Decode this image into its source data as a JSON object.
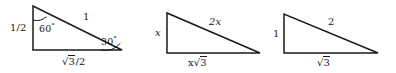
{
  "figure": {
    "background_color": "#ffffff",
    "stroke_color": "#1a1a1a",
    "text_color": "#1a1a1a"
  },
  "triangles": [
    {
      "id": "triangle-half-unit",
      "vertical_leg_label": "1/2",
      "hypotenuse_label": "1",
      "horizontal_leg_label_parts": {
        "prefix": "",
        "radical": "3",
        "suffix": "/2"
      },
      "horizontal_leg_label_text": "√3/2",
      "top_angle_label": "60",
      "top_angle_degree_symbol": "°",
      "bottom_angle_label": "30",
      "bottom_angle_degree_symbol": "°"
    },
    {
      "id": "triangle-variable-x",
      "vertical_leg_label": "x",
      "hypotenuse_label": "2x",
      "horizontal_leg_label_parts": {
        "prefix": "x",
        "radical": "3",
        "suffix": ""
      },
      "horizontal_leg_label_text": "x√3"
    },
    {
      "id": "triangle-unit-one",
      "vertical_leg_label": "1",
      "hypotenuse_label": "2",
      "horizontal_leg_label_parts": {
        "prefix": "",
        "radical": "3",
        "suffix": ""
      },
      "horizontal_leg_label_text": "√3"
    }
  ]
}
